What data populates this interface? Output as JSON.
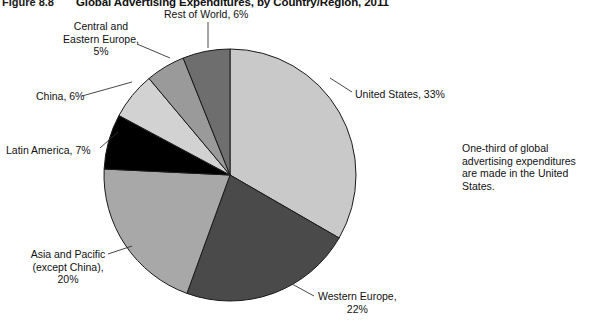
{
  "figure": {
    "number": "Figure 8.8",
    "title": "Global Advertising Expenditures, by Country/Region, 2011"
  },
  "side_note": {
    "text": "One-third of global advertising expenditures are made in the United States."
  },
  "colors": {
    "united_states": "#c9c9c9",
    "western_europe": "#4a4a4a",
    "asia_pacific": "#a8a8a8",
    "latin_america": "#000000",
    "china": "#d2d2d2",
    "central_eastern_europe": "#9a9a9a",
    "rest_of_world": "#6e6e6e",
    "outline": "#1a1a1a",
    "leader": "#333333",
    "background": "#ffffff"
  },
  "geometry": {
    "cx": 230,
    "cy": 175,
    "r": 126,
    "start_angle_deg": -90
  },
  "labels": {
    "united_states": "United States, 33%",
    "western_europe": "Western Europe,\n22%",
    "asia_pacific": "Asia and Pacific\n(except China),\n20%",
    "latin_america": "Latin America, 7%",
    "china": "China, 6%",
    "central_eastern_europe": "Central and\nEastern Europe,\n5%",
    "rest_of_world": "Rest of World, 6%"
  },
  "leaders": [
    {
      "name": "leader-rest-of-world",
      "x1": 208,
      "y1": 22,
      "x2": 208,
      "y2": 48
    },
    {
      "name": "leader-central-eastern-europe",
      "x1": 137,
      "y1": 44,
      "x2": 170,
      "y2": 58
    },
    {
      "name": "leader-china",
      "x1": 82,
      "y1": 96,
      "x2": 132,
      "y2": 82
    },
    {
      "name": "leader-latin-america",
      "x1": 100,
      "y1": 148,
      "x2": 118,
      "y2": 132
    },
    {
      "name": "leader-asia-pacific",
      "x1": 108,
      "y1": 254,
      "x2": 132,
      "y2": 246
    },
    {
      "name": "leader-western-europe",
      "x1": 314,
      "y1": 296,
      "x2": 292,
      "y2": 284
    },
    {
      "name": "leader-united-states",
      "x1": 352,
      "y1": 92,
      "x2": 330,
      "y2": 78
    }
  ],
  "chart_data": {
    "type": "pie",
    "title": "Global Advertising Expenditures, by Country/Region, 2011",
    "unit": "percent",
    "total": 99,
    "legend_position": "callout-labels",
    "categories": [
      "United States",
      "Western Europe",
      "Asia and Pacific (except China)",
      "Latin America",
      "China",
      "Central and Eastern Europe",
      "Rest of World"
    ],
    "values": [
      33,
      22,
      20,
      7,
      6,
      5,
      6
    ],
    "slices": [
      {
        "label": "United States",
        "value": 33,
        "color": "#c9c9c9"
      },
      {
        "label": "Western Europe",
        "value": 22,
        "color": "#4a4a4a"
      },
      {
        "label": "Asia and Pacific (except China)",
        "value": 20,
        "color": "#a8a8a8"
      },
      {
        "label": "Latin America",
        "value": 7,
        "color": "#000000"
      },
      {
        "label": "China",
        "value": 6,
        "color": "#d2d2d2"
      },
      {
        "label": "Central and Eastern Europe",
        "value": 5,
        "color": "#9a9a9a"
      },
      {
        "label": "Rest of World",
        "value": 6,
        "color": "#6e6e6e"
      }
    ],
    "annotation": "One-third of global advertising expenditures are made in the United States."
  }
}
